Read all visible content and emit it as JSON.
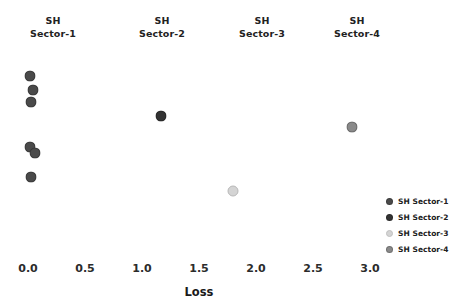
{
  "chart_data": {
    "type": "scatter",
    "title": "",
    "xlabel": "Loss",
    "ylabel": "",
    "xlim": [
      -0.12,
      3.45
    ],
    "ylim": [
      0,
      1
    ],
    "grid": false,
    "legend_position": "bottom-right",
    "xticks": [
      "0.0",
      "0.5",
      "1.0",
      "1.5",
      "2.0",
      "2.5",
      "3.0"
    ],
    "xtick_values": [
      0.0,
      0.5,
      1.0,
      1.5,
      2.0,
      2.5,
      3.0
    ],
    "column_headers": [
      {
        "line1": "SH",
        "line2": "Sector-1"
      },
      {
        "line1": "SH",
        "line2": "Sector-2"
      },
      {
        "line1": "SH",
        "line2": "Sector-3"
      },
      {
        "line1": "SH",
        "line2": "Sector-4"
      }
    ],
    "series": [
      {
        "name": "SH Sector-1",
        "color": "#4a4a4a",
        "points": [
          {
            "x": 0.02,
            "y": 0.885
          },
          {
            "x": 0.04,
            "y": 0.815
          },
          {
            "x": 0.03,
            "y": 0.76
          },
          {
            "x": 0.02,
            "y": 0.545
          },
          {
            "x": 0.06,
            "y": 0.515
          },
          {
            "x": 0.03,
            "y": 0.4
          }
        ]
      },
      {
        "name": "SH Sector-2",
        "color": "#333333",
        "points": [
          {
            "x": 1.17,
            "y": 0.69
          }
        ]
      },
      {
        "name": "SH Sector-3",
        "color": "#d4d4d4",
        "points": [
          {
            "x": 1.8,
            "y": 0.33
          }
        ]
      },
      {
        "name": "SH Sector-4",
        "color": "#8a8a8a",
        "points": [
          {
            "x": 2.84,
            "y": 0.64
          }
        ]
      }
    ],
    "legend": [
      {
        "label": "SH Sector-1",
        "color": "#4a4a4a"
      },
      {
        "label": "SH Sector-2",
        "color": "#333333"
      },
      {
        "label": "SH Sector-3",
        "color": "#d4d4d4"
      },
      {
        "label": "SH Sector-4",
        "color": "#8a8a8a"
      }
    ]
  }
}
